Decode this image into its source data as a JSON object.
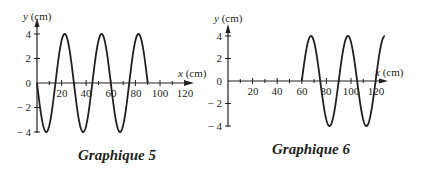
{
  "chart_data": [
    {
      "type": "line",
      "title": "Graphique 5",
      "xlabel": "x (cm)",
      "ylabel": "y (cm)",
      "x_ticks": [
        20,
        40,
        60,
        80,
        100,
        120
      ],
      "y_ticks": [
        4,
        2,
        0,
        -2,
        -4
      ],
      "xlim": [
        0,
        125
      ],
      "ylim": [
        -4,
        4
      ],
      "grid": false,
      "curve": {
        "function": "y = -4 sin(2πx/30)",
        "amplitude": 4,
        "wavelength": 30,
        "x_start": 0,
        "x_end": 90,
        "x": [
          0,
          7.5,
          15,
          22.5,
          30,
          37.5,
          45,
          52.5,
          60,
          67.5,
          75,
          82.5,
          90
        ],
        "y": [
          0,
          -4,
          0,
          4,
          0,
          -4,
          0,
          4,
          0,
          -4,
          0,
          4,
          0
        ]
      }
    },
    {
      "type": "line",
      "title": "Graphique 6",
      "xlabel": "x (cm)",
      "ylabel": "y (cm)",
      "x_ticks": [
        20,
        40,
        60,
        80,
        100,
        120
      ],
      "y_ticks": [
        4,
        2,
        0,
        -2,
        -4
      ],
      "xlim": [
        0,
        125
      ],
      "ylim": [
        -4,
        4
      ],
      "grid": false,
      "curve": {
        "function": "y = 4 sin(2π(x-60)/30)",
        "amplitude": 4,
        "wavelength": 30,
        "x_start": 60,
        "x_end": 127.5,
        "x": [
          60,
          67.5,
          75,
          82.5,
          90,
          97.5,
          105,
          112.5,
          120,
          127.5
        ],
        "y": [
          0,
          4,
          0,
          -4,
          0,
          4,
          0,
          -4,
          0,
          4
        ]
      }
    }
  ],
  "graphs": [
    {
      "caption": "Graphique 5",
      "ylabel_var": "y",
      "ylabel_unit": " (cm)",
      "xlabel_var": "x",
      "xlabel_unit": " (cm)",
      "y_tick_labels": [
        "4",
        "2",
        "0",
        "− 2",
        "− 4"
      ],
      "x_tick_labels": [
        "20",
        "40",
        "60",
        "80",
        "100",
        "120"
      ]
    },
    {
      "caption": "Graphique 6",
      "ylabel_var": "y",
      "ylabel_unit": " (cm)",
      "xlabel_var": "x",
      "xlabel_unit": " (cm)",
      "y_tick_labels": [
        "4",
        "2",
        "0",
        "− 2",
        "− 4"
      ],
      "x_tick_labels": [
        "20",
        "40",
        "60",
        "80",
        "100",
        "120"
      ]
    }
  ],
  "colors": {
    "ink": "#231f20",
    "background": "#ffffff"
  }
}
